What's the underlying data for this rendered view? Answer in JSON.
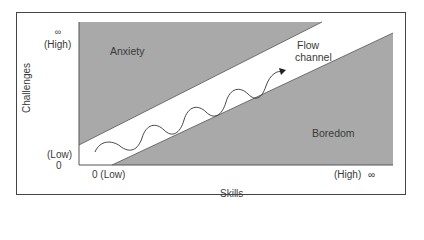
{
  "diagram": {
    "title": "",
    "y_axis": {
      "label": "Challenges",
      "high_symbol": "∞",
      "high_label": "(High)",
      "low_label": "(Low)",
      "low_value": "0"
    },
    "x_axis": {
      "label": "Skills",
      "low_label": "0 (Low)",
      "high_label": "(High)",
      "high_symbol": "∞"
    },
    "regions": {
      "anxiety": "Anxiety",
      "flow_line1": "Flow",
      "flow_line2": "channel",
      "boredom": "Boredom"
    },
    "colors": {
      "shaded": "#a9a9a9",
      "band": "#ffffff",
      "line": "#444444"
    }
  }
}
